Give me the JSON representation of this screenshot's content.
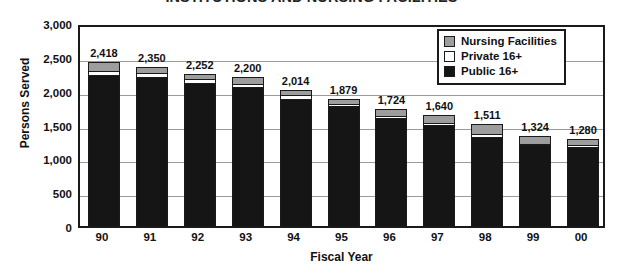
{
  "chart_data": {
    "type": "bar",
    "subtype": "stacked-vertical",
    "title": "INSTITUTIONS AND NURSING FACILITIES",
    "xlabel": "Fiscal Year",
    "ylabel": "Persons Served",
    "categories": [
      "90",
      "91",
      "92",
      "93",
      "94",
      "95",
      "96",
      "97",
      "98",
      "99",
      "00"
    ],
    "totals": [
      2418,
      2350,
      2252,
      2200,
      2014,
      1879,
      1724,
      1640,
      1511,
      1324,
      1280
    ],
    "total_labels": [
      "2,418",
      "2,350",
      "2,252",
      "2,200",
      "2,014",
      "1,879",
      "1,724",
      "1,640",
      "1,511",
      "1,324",
      "1,280"
    ],
    "series": [
      {
        "name": "Public 16+",
        "color": "#151515",
        "values": [
          2215,
          2180,
          2105,
          2040,
          1860,
          1760,
          1580,
          1485,
          1295,
          1175,
          1150
        ]
      },
      {
        "name": "Private 16+",
        "color": "#ffffff",
        "values": [
          63,
          60,
          52,
          45,
          64,
          34,
          30,
          25,
          46,
          29,
          25
        ]
      },
      {
        "name": "Nursing Facilities",
        "color": "#9d9d9d",
        "values": [
          140,
          110,
          95,
          115,
          90,
          85,
          114,
          130,
          170,
          120,
          105
        ]
      }
    ],
    "legend": {
      "position": "top-right",
      "entries": [
        {
          "label": "Nursing Facilities",
          "color": "#9d9d9d"
        },
        {
          "label": "Private 16+",
          "color": "#ffffff"
        },
        {
          "label": "Public 16+",
          "color": "#151515"
        }
      ]
    },
    "ylim": [
      0,
      3000
    ],
    "ytick_values": [
      0,
      500,
      1000,
      1500,
      2000,
      2500,
      3000
    ],
    "ytick_labels": [
      "0",
      "500",
      "1,000",
      "1,500",
      "2,000",
      "2,500",
      "3,000"
    ],
    "grid": "horizontal",
    "data_labels": true
  }
}
